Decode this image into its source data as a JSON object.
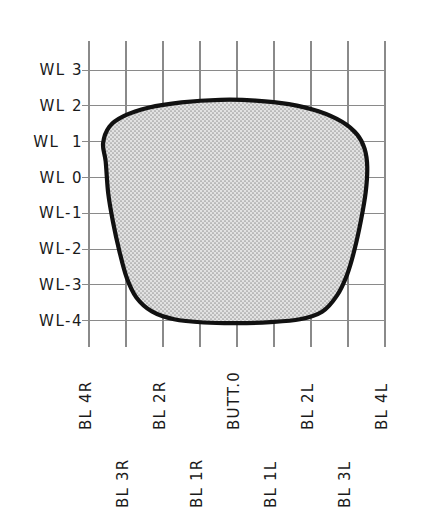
{
  "figure": {
    "kind": "hull-body-plan-section",
    "background_color": "#ffffff",
    "grid_color": "#8a8a8a",
    "outline_color": "#111111",
    "fill_color": "#dedede",
    "stipple_color": "#9a9a9a"
  },
  "axes": {
    "y_axis_name": "waterline",
    "x_axis_name": "buttock-line",
    "y_labels": [
      "WL 3",
      "WL 2",
      "WL  1",
      "WL 0",
      "WL-1",
      "WL-2",
      "WL-3",
      "WL-4"
    ],
    "x_labels_upper": [
      "BL 4R",
      "BL 2R",
      "BUTT.0",
      "BL 2L",
      "BL 4L"
    ],
    "x_labels_lower": [
      "BL 3R",
      "BL 1R",
      "BL 1L",
      "BL 3L"
    ]
  },
  "chart_data": {
    "type": "line",
    "title": "",
    "xlabel": "",
    "ylabel": "",
    "grid": true,
    "legend": "none",
    "x_categories": [
      "BL 4R",
      "BL 3R",
      "BL 2R",
      "BL 1R",
      "BUTT.0",
      "BL 1L",
      "BL 2L",
      "BL 3L",
      "BL 4L"
    ],
    "x_values": [
      -4,
      -3,
      -2,
      -1,
      0,
      1,
      2,
      3,
      4
    ],
    "y_tick_labels": [
      "WL 3",
      "WL 2",
      "WL  1",
      "WL 0",
      "WL-1",
      "WL-2",
      "WL-3",
      "WL-4"
    ],
    "y_values": [
      3,
      2,
      1,
      0,
      -1,
      -2,
      -3,
      -4
    ],
    "xlim": [
      -4,
      4
    ],
    "ylim": [
      -4.5,
      3.5
    ],
    "series": [
      {
        "name": "hull-section-outline",
        "closed": true,
        "filled": true,
        "points": [
          [
            -3.55,
            0.45
          ],
          [
            -3.62,
            0.95
          ],
          [
            -3.45,
            1.42
          ],
          [
            -3.05,
            1.72
          ],
          [
            -2.4,
            1.95
          ],
          [
            -1.5,
            2.1
          ],
          [
            -0.45,
            2.17
          ],
          [
            0.5,
            2.15
          ],
          [
            1.4,
            2.05
          ],
          [
            2.2,
            1.85
          ],
          [
            2.85,
            1.55
          ],
          [
            3.25,
            1.2
          ],
          [
            3.45,
            0.8
          ],
          [
            3.52,
            0.3
          ],
          [
            3.48,
            -0.4
          ],
          [
            3.35,
            -1.2
          ],
          [
            3.18,
            -2.0
          ],
          [
            2.98,
            -2.7
          ],
          [
            2.7,
            -3.3
          ],
          [
            2.3,
            -3.75
          ],
          [
            1.7,
            -3.96
          ],
          [
            0.9,
            -4.04
          ],
          [
            0.0,
            -4.07
          ],
          [
            -0.9,
            -4.05
          ],
          [
            -1.7,
            -3.96
          ],
          [
            -2.3,
            -3.74
          ],
          [
            -2.72,
            -3.35
          ],
          [
            -2.98,
            -2.8
          ],
          [
            -3.18,
            -2.05
          ],
          [
            -3.35,
            -1.25
          ],
          [
            -3.48,
            -0.45
          ],
          [
            -3.55,
            0.45
          ]
        ]
      }
    ]
  }
}
